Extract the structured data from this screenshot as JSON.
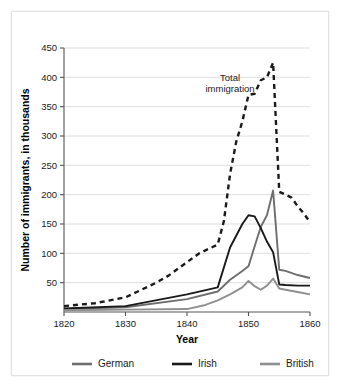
{
  "chart_data": {
    "type": "line",
    "title": "",
    "xlabel": "Year",
    "ylabel": "Number of immigrants, in thousands",
    "xlim": [
      1820,
      1860
    ],
    "ylim": [
      0,
      450
    ],
    "xticks": [
      1820,
      1830,
      1840,
      1850,
      1860
    ],
    "yticks": [
      50,
      100,
      150,
      200,
      250,
      300,
      350,
      400,
      450
    ],
    "grid": "horizontal",
    "legend_position": "bottom",
    "annotations": [
      {
        "name": "total-immigration-label",
        "lines": [
          "Total",
          "immigration"
        ],
        "x": 1847.0,
        "y": 393
      }
    ],
    "series": [
      {
        "name": "Total immigration",
        "style": "dashed",
        "color": "#1a1a1a",
        "in_legend": false,
        "x": [
          1820,
          1825,
          1830,
          1832,
          1835,
          1837,
          1840,
          1842,
          1845,
          1846,
          1847,
          1848,
          1849,
          1850,
          1851,
          1852,
          1853,
          1854,
          1855,
          1856,
          1857,
          1858,
          1859,
          1860
        ],
        "values": [
          10,
          15,
          25,
          35,
          50,
          62,
          85,
          100,
          115,
          155,
          235,
          290,
          325,
          370,
          372,
          395,
          400,
          425,
          205,
          200,
          195,
          180,
          168,
          153
        ]
      },
      {
        "name": "German",
        "style": "solid",
        "color": "#6e6e6e",
        "in_legend": true,
        "x": [
          1820,
          1830,
          1840,
          1845,
          1847,
          1849,
          1850,
          1851,
          1852,
          1853,
          1854,
          1855,
          1856,
          1858,
          1860
        ],
        "values": [
          5,
          8,
          22,
          35,
          55,
          70,
          78,
          112,
          145,
          165,
          207,
          72,
          70,
          63,
          58
        ]
      },
      {
        "name": "Irish",
        "style": "solid",
        "color": "#1a1a1a",
        "in_legend": true,
        "x": [
          1820,
          1830,
          1840,
          1845,
          1847,
          1849,
          1850,
          1851,
          1852,
          1853,
          1854,
          1855,
          1856,
          1858,
          1860
        ],
        "values": [
          6,
          10,
          30,
          42,
          110,
          150,
          165,
          163,
          143,
          120,
          102,
          47,
          46,
          45,
          45
        ]
      },
      {
        "name": "British",
        "style": "solid",
        "color": "#8f8f8f",
        "in_legend": true,
        "x": [
          1820,
          1830,
          1840,
          1843,
          1845,
          1847,
          1849,
          1850,
          1851,
          1852,
          1853,
          1854,
          1855,
          1856,
          1858,
          1860
        ],
        "values": [
          3,
          4,
          5,
          12,
          20,
          30,
          42,
          53,
          44,
          38,
          45,
          57,
          40,
          38,
          34,
          30
        ]
      }
    ],
    "legend": [
      {
        "label": "German",
        "color": "#6e6e6e"
      },
      {
        "label": "Irish",
        "color": "#1a1a1a"
      },
      {
        "label": "British",
        "color": "#8f8f8f"
      }
    ]
  }
}
